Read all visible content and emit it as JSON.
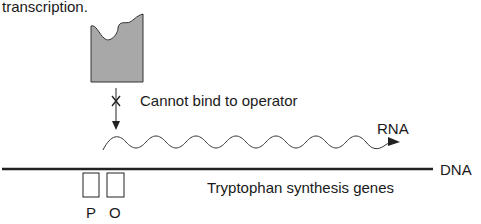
{
  "caption_fragment": "transcription.",
  "repressor": {
    "fill": "#a8a8a8",
    "stroke": "#333333"
  },
  "annotation": "Cannot bind to operator",
  "labels": {
    "rna": "RNA",
    "dna": "DNA",
    "genes": "Tryptophan synthesis genes",
    "promoter": "P",
    "operator": "O"
  },
  "colors": {
    "line": "#222222",
    "text": "#1a1a1a"
  }
}
